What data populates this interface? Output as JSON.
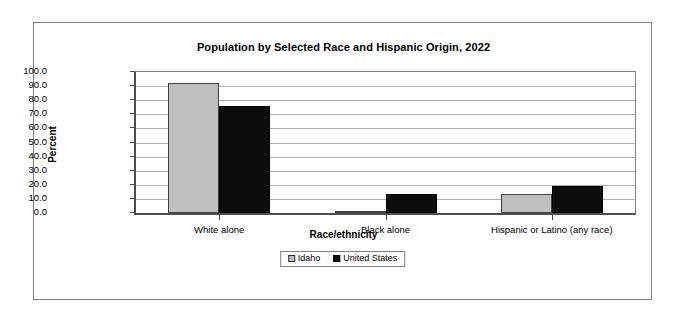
{
  "chart_data": {
    "type": "bar",
    "title": "Population by Selected Race and Hispanic Origin, 2022",
    "xlabel": "Race/ethnicity",
    "ylabel": "Percent",
    "categories": [
      "White alone",
      "Black alone",
      "Hispanic or Latino (any race)"
    ],
    "series": [
      {
        "name": "Idaho",
        "color": "#bfbfbf",
        "values": [
          92.5,
          1.0,
          13.5
        ]
      },
      {
        "name": "United States",
        "color": "#0d0d0d",
        "values": [
          75.8,
          13.6,
          19.1
        ]
      }
    ],
    "ylim": [
      0.0,
      100.0
    ],
    "ytick_step": 10.0,
    "ytick_labels": [
      "100.0",
      "90.0",
      "80.0",
      "70.0",
      "60.0",
      "50.0",
      "40.0",
      "30.0",
      "20.0",
      "10.0",
      "0.0"
    ],
    "ytick_values": [
      100.0,
      90.0,
      80.0,
      70.0,
      60.0,
      50.0,
      40.0,
      30.0,
      20.0,
      10.0,
      0.0
    ],
    "grid": true,
    "legend_position": "bottom",
    "legend_entries": [
      "Idaho",
      "United States"
    ]
  }
}
